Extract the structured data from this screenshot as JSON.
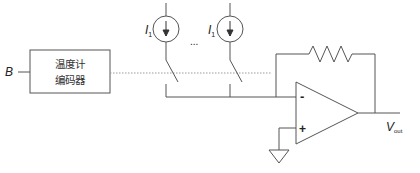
{
  "diagram": {
    "type": "circuit",
    "input": {
      "label": "B"
    },
    "encoder": {
      "line1": "温度计",
      "line2": "编码器"
    },
    "current_sources": [
      {
        "label": "I",
        "subscript": "1"
      },
      {
        "label": "I",
        "subscript": "1"
      }
    ],
    "ellipsis": "...",
    "opamp": {
      "inverting": "-",
      "noninverting": "+"
    },
    "output": {
      "label": "V",
      "subscript": "out"
    },
    "colors": {
      "line": "#555555",
      "dotted": "#9a9a9a",
      "text": "#222222"
    }
  }
}
